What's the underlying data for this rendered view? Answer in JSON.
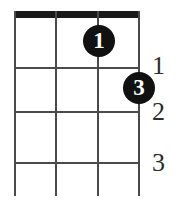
{
  "diagram": {
    "type": "chord-diagram",
    "instrument": "ukulele",
    "string_count": 4,
    "fret_count": 3,
    "nut_visible": true,
    "colors": {
      "nut": "#1a1a1a",
      "grid": "#4a4a4a",
      "dot_fill": "#111111",
      "dot_text": "#ffffff",
      "fret_label": "#2b2b2b",
      "background": "#ffffff"
    },
    "fret_labels": [
      {
        "label": "1"
      },
      {
        "label": "2"
      },
      {
        "label": "3"
      }
    ],
    "finger_dots": [
      {
        "label": "1",
        "string": 3,
        "fret": 1
      },
      {
        "label": "3",
        "string": 4,
        "fret": 2
      }
    ]
  }
}
